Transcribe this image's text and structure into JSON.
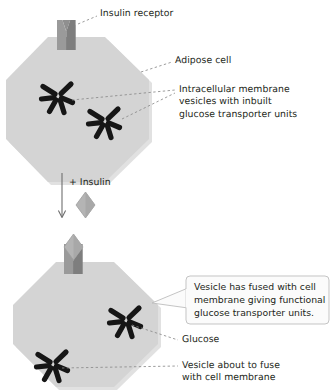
{
  "figure": {
    "colors": {
      "cell_fill": "#d4d4d4",
      "cell_shadow": "#c3c3c3",
      "receptor_fill": "#8f8f8f",
      "receptor_dark": "#6f6f6f",
      "insulin_fill": "#b4b4b4",
      "vesicle_bar": "#161616",
      "text": "#231f20",
      "leader_line": "#8a8a8a",
      "callout_border": "#b9b9b9"
    }
  },
  "labels": {
    "insulin_receptor": "Insulin receptor",
    "adipose_cell": "Adipose cell",
    "intracellular_vesicles": "Intracellular membrane\nvesicles with inbuilt\nglucose transporter units",
    "plus_insulin": "+ Insulin",
    "glucose": "Glucose",
    "vesicle_about_to_fuse": "Vesicle about to fuse\nwith cell membrane"
  },
  "callout": {
    "text": "Vesicle has fused with cell\nmembrane giving functional\nglucose transporter units."
  },
  "icons": {
    "top_cell": "adipose-cell-octagon",
    "bottom_cell": "adipose-cell-octagon",
    "receptor_top": "insulin-receptor-icon",
    "receptor_bottom": "insulin-receptor-icon",
    "insulin_free": "insulin-molecule-icon",
    "insulin_bound": "insulin-molecule-icon",
    "arrow": "down-arrow-icon",
    "vesicle_1": "vesicle-starburst-icon",
    "vesicle_2": "vesicle-starburst-icon",
    "vesicle_fused": "vesicle-starburst-icon",
    "vesicle_pending": "vesicle-starburst-icon"
  }
}
